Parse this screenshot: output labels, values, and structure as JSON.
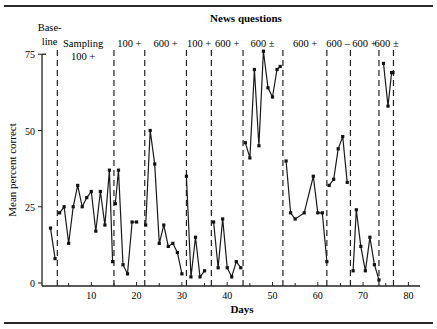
{
  "chart_data": {
    "type": "line",
    "title": "News questions",
    "xlabel": "Days",
    "ylabel": "Mean percent correct",
    "xlim": [
      0,
      82
    ],
    "ylim": [
      0,
      75
    ],
    "xticks": [
      10,
      20,
      30,
      40,
      50,
      60,
      70,
      80
    ],
    "xticks_minor": [
      5,
      15,
      25,
      35,
      45,
      55,
      65,
      75
    ],
    "yticks": [
      0,
      25,
      50,
      75
    ],
    "grid": false,
    "legend": null,
    "phase_dividers_days": [
      2.5,
      15,
      21.8,
      31,
      36.5,
      43.5,
      52.3,
      62,
      67.2,
      73.5,
      76.7
    ],
    "phase_labels": [
      {
        "label": "Base-\nline",
        "x_day": 0.8,
        "row": 1
      },
      {
        "label": "Sampling",
        "x_day": 8.2,
        "row": 2
      },
      {
        "label": "100 +",
        "x_day": 8.2,
        "row": 3
      },
      {
        "label": "100 +",
        "x_day": 18.4,
        "row": 2
      },
      {
        "label": "600 +",
        "x_day": 26.4,
        "row": 2
      },
      {
        "label": "100 +",
        "x_day": 33.8,
        "row": 2
      },
      {
        "label": "600 +",
        "x_day": 40,
        "row": 2
      },
      {
        "label": "600 ±",
        "x_day": 47.8,
        "row": 2
      },
      {
        "label": "600 +",
        "x_day": 57.2,
        "row": 2
      },
      {
        "label": "600 –",
        "x_day": 64.5,
        "row": 2
      },
      {
        "label": "600 +",
        "x_day": 70.3,
        "row": 2
      },
      {
        "label": "600 ±",
        "x_day": 75.2,
        "row": 2
      }
    ],
    "series": [
      {
        "name": "Baseline",
        "points": [
          [
            1,
            18
          ],
          [
            2,
            8
          ]
        ]
      },
      {
        "name": "Sampling 100+",
        "points": [
          [
            3,
            23
          ],
          [
            4,
            25
          ],
          [
            5,
            13
          ],
          [
            6,
            25
          ],
          [
            7,
            32
          ],
          [
            8,
            25
          ],
          [
            9,
            28
          ],
          [
            10,
            30
          ],
          [
            11,
            17
          ],
          [
            12,
            30
          ],
          [
            13,
            19
          ],
          [
            14,
            37
          ],
          [
            14.7,
            7
          ]
        ]
      },
      {
        "name": "100+ (a)",
        "points": [
          [
            15.3,
            26
          ],
          [
            16,
            37
          ],
          [
            17,
            6
          ],
          [
            18,
            3
          ],
          [
            19,
            20
          ],
          [
            20,
            20
          ]
        ]
      },
      {
        "name": "600+ (a)",
        "points": [
          [
            22,
            19
          ],
          [
            23,
            50
          ],
          [
            24,
            39
          ],
          [
            25,
            13
          ],
          [
            26,
            19
          ],
          [
            27,
            12
          ],
          [
            28,
            13
          ],
          [
            29,
            10
          ],
          [
            30,
            3
          ]
        ]
      },
      {
        "name": "100+ (b)",
        "points": [
          [
            31,
            35
          ],
          [
            32,
            2
          ],
          [
            33,
            15
          ],
          [
            34,
            2
          ],
          [
            35,
            4
          ]
        ]
      },
      {
        "name": "600+ (b)",
        "points": [
          [
            37,
            20
          ],
          [
            38,
            5
          ],
          [
            39,
            21
          ],
          [
            40,
            5
          ],
          [
            41,
            2
          ],
          [
            42,
            7
          ],
          [
            43,
            5
          ]
        ]
      },
      {
        "name": "600± (a)",
        "points": [
          [
            44,
            46
          ],
          [
            45,
            41
          ],
          [
            46,
            70
          ],
          [
            47,
            45
          ],
          [
            48,
            76
          ],
          [
            49,
            64
          ],
          [
            50,
            61
          ],
          [
            51,
            70
          ],
          [
            51.7,
            71
          ]
        ]
      },
      {
        "name": "600+ (c)",
        "points": [
          [
            53,
            40
          ],
          [
            54,
            23
          ],
          [
            55,
            21
          ],
          [
            57,
            23
          ],
          [
            59,
            35
          ],
          [
            60,
            23
          ],
          [
            61,
            23
          ],
          [
            62,
            7
          ]
        ]
      },
      {
        "name": "600– ",
        "points": [
          [
            62.5,
            32
          ],
          [
            63.5,
            34
          ],
          [
            64.5,
            44
          ],
          [
            65.5,
            48
          ],
          [
            66.5,
            33
          ]
        ]
      },
      {
        "name": "600+ (d)",
        "points": [
          [
            67.8,
            4
          ],
          [
            68.5,
            24
          ],
          [
            69.5,
            12
          ],
          [
            70.5,
            4
          ],
          [
            71.5,
            15
          ],
          [
            72.5,
            6
          ],
          [
            73.5,
            1
          ]
        ]
      },
      {
        "name": "600± (b)",
        "points": [
          [
            74.5,
            72
          ],
          [
            75.5,
            58
          ],
          [
            76.3,
            69
          ],
          [
            76.6,
            69
          ]
        ]
      }
    ]
  },
  "labels": {
    "title": "News questions",
    "xlabel": "Days",
    "ylabel": "Mean percent correct"
  }
}
